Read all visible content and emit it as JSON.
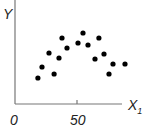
{
  "chart_data": {
    "type": "scatter",
    "title": "",
    "xlabel": "X",
    "xlabel_subscript": "1",
    "ylabel": "Y",
    "x_ticks": [
      "0",
      "50"
    ],
    "xlim": [
      0,
      87
    ],
    "ylim": [
      0,
      104
    ],
    "grid": false,
    "legend": null,
    "series": [
      {
        "name": "observations",
        "color": "#000000",
        "points": [
          {
            "x": 18.5,
            "y": 26
          },
          {
            "x": 21.8,
            "y": 37
          },
          {
            "x": 27.4,
            "y": 51
          },
          {
            "x": 31.5,
            "y": 30
          },
          {
            "x": 35.5,
            "y": 46
          },
          {
            "x": 37.9,
            "y": 66
          },
          {
            "x": 41.9,
            "y": 56
          },
          {
            "x": 50.8,
            "y": 61
          },
          {
            "x": 54.8,
            "y": 71
          },
          {
            "x": 58.9,
            "y": 59
          },
          {
            "x": 64.5,
            "y": 45
          },
          {
            "x": 67.7,
            "y": 66
          },
          {
            "x": 71.8,
            "y": 50
          },
          {
            "x": 75.8,
            "y": 30
          },
          {
            "x": 79.0,
            "y": 40
          },
          {
            "x": 88.7,
            "y": 40
          }
        ]
      }
    ]
  },
  "labels": {
    "y_axis": "Y",
    "x_axis": "X",
    "x_axis_sub": "1",
    "tick_0": "0",
    "tick_50": "50"
  }
}
